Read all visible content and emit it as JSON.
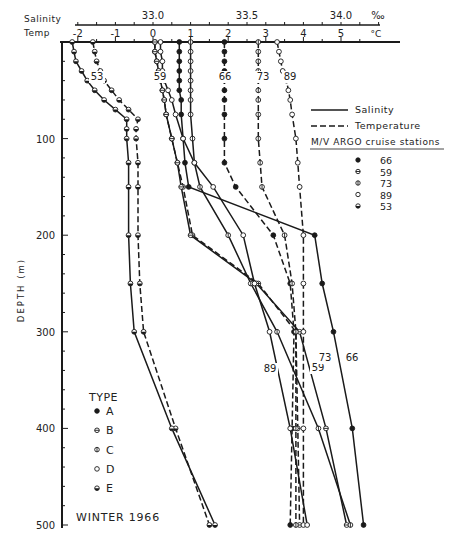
{
  "chart_data": {
    "type": "line",
    "title": "",
    "season_label": "WINTER 1966",
    "x_axes": {
      "salinity": {
        "label": "Salinity",
        "unit": "‰",
        "ticks": [
          33.0,
          33.5,
          34.0
        ],
        "tick_labels": [
          "33.0",
          "33.5",
          "34.0"
        ],
        "range": [
          33.0,
          34.05
        ]
      },
      "temperature": {
        "label": "Temp",
        "unit": "°C",
        "ticks": [
          -2,
          -1,
          0,
          1,
          2,
          3,
          4,
          5
        ],
        "tick_labels": [
          "-2",
          "-1",
          "0",
          "1",
          "2",
          "3",
          "4",
          "5"
        ],
        "range": [
          -2.2,
          5.8
        ]
      }
    },
    "ylabel": "DEPTH (m)",
    "y_ticks": [
      100,
      200,
      300,
      400,
      500
    ],
    "y_tick_labels": [
      "100",
      "200",
      "300",
      "400",
      "500"
    ],
    "ylim": [
      0,
      500
    ],
    "y_inverted": true,
    "legend": {
      "lines": [
        {
          "label": "Salinity",
          "style": "solid"
        },
        {
          "label": "Temperature",
          "style": "dashed"
        }
      ],
      "stations_title": "M/V ARGO cruise stations",
      "stations": [
        {
          "marker": "filled",
          "label": "66"
        },
        {
          "marker": "horizontal-bar",
          "label": "59"
        },
        {
          "marker": "vertical-bar",
          "label": "73"
        },
        {
          "marker": "open",
          "label": "89"
        },
        {
          "marker": "half-filled",
          "label": "53"
        }
      ],
      "type_title": "TYPE",
      "types": [
        {
          "marker": "filled",
          "label": "A"
        },
        {
          "marker": "horizontal-bar",
          "label": "B"
        },
        {
          "marker": "vertical-bar",
          "label": "C"
        },
        {
          "marker": "open",
          "label": "D"
        },
        {
          "marker": "half-filled",
          "label": "E"
        }
      ]
    },
    "series": [
      {
        "name": "Station 53 Temperature",
        "station": "53",
        "variable": "temperature",
        "style": "dashed",
        "marker": "half-filled",
        "depth": [
          0,
          10,
          20,
          30,
          40,
          50,
          60,
          70,
          80,
          90,
          100,
          125,
          150,
          200,
          250,
          300,
          400,
          500
        ],
        "values": [
          -1.6,
          -1.55,
          -1.5,
          -1.4,
          -1.3,
          -1.1,
          -0.9,
          -0.65,
          -0.4,
          -0.45,
          -0.45,
          -0.4,
          -0.4,
          -0.4,
          -0.35,
          -0.25,
          0.6,
          1.5
        ]
      },
      {
        "name": "Station 53 Salinity",
        "station": "53",
        "variable": "salinity",
        "style": "solid",
        "marker": "half-filled",
        "depth": [
          0,
          10,
          20,
          30,
          40,
          50,
          60,
          70,
          80,
          90,
          100,
          125,
          150,
          200,
          250,
          300,
          400,
          500
        ],
        "values": [
          32.57,
          32.58,
          32.59,
          32.62,
          32.65,
          32.69,
          32.74,
          32.8,
          32.86,
          32.86,
          32.86,
          32.87,
          32.87,
          32.87,
          32.88,
          32.9,
          33.1,
          33.33
        ]
      },
      {
        "name": "Station 59 Temperature",
        "station": "59",
        "variable": "temperature",
        "style": "dashed",
        "marker": "horizontal-bar",
        "depth": [
          0,
          10,
          20,
          30,
          40,
          50,
          60,
          75,
          100,
          125,
          150,
          200,
          250,
          300,
          400,
          500
        ],
        "values": [
          0.05,
          0.05,
          0.1,
          0.15,
          0.2,
          0.25,
          0.3,
          0.35,
          0.5,
          0.65,
          0.8,
          1.05,
          2.8,
          3.8,
          3.85,
          3.9
        ]
      },
      {
        "name": "Station 59 Salinity",
        "station": "59",
        "variable": "salinity",
        "style": "solid",
        "marker": "horizontal-bar",
        "depth": [
          0,
          10,
          20,
          30,
          40,
          50,
          60,
          75,
          100,
          125,
          150,
          200,
          250,
          300,
          400,
          500
        ],
        "values": [
          33.01,
          33.01,
          33.02,
          33.03,
          33.04,
          33.05,
          33.06,
          33.07,
          33.1,
          33.13,
          33.15,
          33.2,
          33.55,
          33.78,
          33.92,
          34.03
        ]
      },
      {
        "name": "Station 66 Temperature",
        "station": "66",
        "variable": "temperature",
        "style": "dashed",
        "marker": "filled",
        "depth": [
          0,
          10,
          20,
          30,
          40,
          50,
          60,
          75,
          100,
          125,
          150,
          200,
          250,
          300,
          400,
          500
        ],
        "values": [
          1.9,
          1.9,
          1.9,
          1.9,
          1.9,
          1.9,
          1.9,
          1.9,
          1.9,
          1.9,
          2.2,
          3.2,
          3.65,
          3.75,
          3.7,
          3.65
        ]
      },
      {
        "name": "Station 66 Salinity",
        "station": "66",
        "variable": "salinity",
        "style": "solid",
        "marker": "filled",
        "depth": [
          0,
          10,
          20,
          30,
          40,
          50,
          60,
          75,
          100,
          125,
          150,
          200,
          250,
          300,
          400,
          500
        ],
        "values": [
          33.14,
          33.14,
          33.14,
          33.14,
          33.14,
          33.14,
          33.15,
          33.15,
          33.16,
          33.17,
          33.19,
          33.86,
          33.9,
          33.96,
          34.06,
          34.12
        ]
      },
      {
        "name": "Station 73 Temperature",
        "station": "73",
        "variable": "temperature",
        "style": "dashed",
        "marker": "vertical-bar",
        "depth": [
          0,
          10,
          20,
          30,
          40,
          50,
          60,
          75,
          100,
          125,
          150,
          200,
          250,
          300,
          400,
          500
        ],
        "values": [
          2.8,
          2.8,
          2.8,
          2.8,
          2.8,
          2.8,
          2.8,
          2.8,
          2.8,
          2.85,
          2.9,
          3.5,
          3.7,
          3.8,
          3.8,
          3.8
        ]
      },
      {
        "name": "Station 73 Salinity",
        "station": "73",
        "variable": "salinity",
        "style": "solid",
        "marker": "vertical-bar",
        "depth": [
          0,
          10,
          20,
          30,
          40,
          50,
          60,
          75,
          100,
          125,
          150,
          200,
          250,
          300,
          400,
          500
        ],
        "values": [
          33.2,
          33.2,
          33.2,
          33.2,
          33.2,
          33.2,
          33.2,
          33.2,
          33.21,
          33.22,
          33.25,
          33.4,
          33.52,
          33.66,
          33.88,
          34.05
        ]
      },
      {
        "name": "Station 89 Temperature",
        "station": "89",
        "variable": "temperature",
        "style": "dashed",
        "marker": "open",
        "depth": [
          0,
          10,
          20,
          30,
          40,
          50,
          60,
          75,
          100,
          125,
          150,
          200,
          250,
          300,
          400,
          500
        ],
        "values": [
          3.3,
          3.35,
          3.4,
          3.45,
          3.55,
          3.6,
          3.65,
          3.7,
          3.8,
          3.85,
          3.9,
          4.0,
          4.0,
          4.0,
          4.0,
          4.0
        ]
      },
      {
        "name": "Station 89 Salinity",
        "station": "89",
        "variable": "salinity",
        "style": "solid",
        "marker": "open",
        "depth": [
          0,
          10,
          20,
          30,
          40,
          50,
          60,
          75,
          100,
          125,
          150,
          200,
          250,
          300,
          400,
          500
        ],
        "values": [
          33.04,
          33.04,
          33.05,
          33.05,
          33.06,
          33.08,
          33.1,
          33.12,
          33.16,
          33.22,
          33.32,
          33.48,
          33.54,
          33.62,
          33.73,
          33.82
        ]
      }
    ],
    "grid": false,
    "legend_position": "upper-right and lower-left"
  },
  "labels": {
    "salinity_axis": "Salinity",
    "temp_axis": "Temp",
    "salinity_unit": "‰",
    "temp_unit": "°C",
    "depth_axis": "DEPTH (m)",
    "legend_salinity": "Salinity",
    "legend_temperature": "Temperature",
    "stations_title": "M/V ARGO cruise stations",
    "type_title": "TYPE",
    "season": "WINTER 1966"
  }
}
